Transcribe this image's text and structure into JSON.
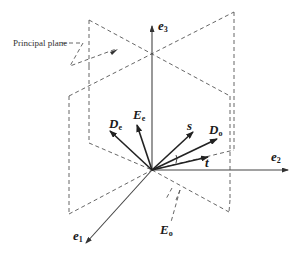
{
  "figure": {
    "annotation": "Principal plane",
    "axes": [
      {
        "id": "e1",
        "base": "e",
        "sub": "1"
      },
      {
        "id": "e2",
        "base": "e",
        "sub": "2"
      },
      {
        "id": "e3",
        "base": "e",
        "sub": "3"
      }
    ],
    "vectors": [
      {
        "id": "De",
        "base": "D",
        "sub": "e"
      },
      {
        "id": "Ee",
        "base": "E",
        "sub": "e"
      },
      {
        "id": "s",
        "base": "s",
        "sub": ""
      },
      {
        "id": "Do",
        "base": "D",
        "sub": "o"
      },
      {
        "id": "t",
        "base": "t",
        "sub": ""
      },
      {
        "id": "Eo",
        "base": "E",
        "sub": "o"
      }
    ],
    "colors": {
      "line": "#333333",
      "dashed": "#555555",
      "background": "#ffffff"
    }
  }
}
